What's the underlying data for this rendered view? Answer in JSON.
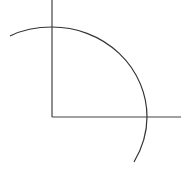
{
  "diagram": {
    "type": "geometric-figure",
    "stroke_color": "#333333",
    "background": "#ffffff",
    "vertical_axis": {
      "x": 52,
      "y1": 0,
      "y2": 117
    },
    "horizontal_axis": {
      "y": 117,
      "x1": 52,
      "x2": 181
    },
    "arc": {
      "center": [
        52,
        117
      ],
      "rx": 95,
      "ry": 90,
      "start": [
        10,
        36
      ],
      "end": [
        134,
        162
      ]
    }
  }
}
